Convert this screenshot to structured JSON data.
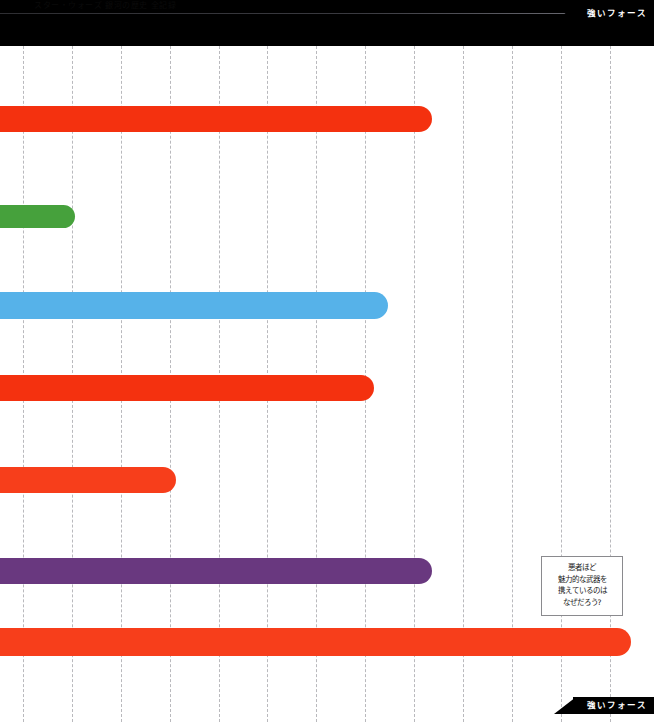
{
  "header": {
    "title": "スター・ウォーズ 銀河の歴史 全記録"
  },
  "tabs": {
    "top_label": "強いフォース",
    "bottom_label": "強いフォース"
  },
  "callout": {
    "lines": [
      "悪者ほど",
      "魅力的な武器を",
      "携えているのは",
      "なぜだろう?"
    ]
  },
  "colors": {
    "red": "#F4310F",
    "red_alt": "#F73E1B",
    "green": "#46A13C",
    "blue": "#56B2E9",
    "purple": "#69387F",
    "grid": "#b9b9bd",
    "black": "#000000",
    "background": "#ffffff"
  },
  "chart_data": {
    "type": "bar",
    "orientation": "horizontal",
    "title": "強いフォース",
    "xlabel": "",
    "ylabel": "",
    "grid": true,
    "legend_position": "none",
    "note": "Horizontal bars extend from off-canvas left edge to the right; values are the pixel x-coordinate of each bar's right end within a 654px-wide canvas.",
    "axis": {
      "gridline_spacing_px": 48.8,
      "gridline_x": [
        23,
        72,
        121,
        170,
        219,
        267,
        316,
        365,
        414,
        463,
        512,
        561,
        610
      ]
    },
    "categories": [
      "bar-1",
      "bar-2",
      "bar-3",
      "bar-4",
      "bar-5",
      "bar-6",
      "bar-7"
    ],
    "values": [
      432,
      75,
      388,
      432,
      176,
      432,
      631
    ],
    "series": [
      {
        "name": "strong-force-bars",
        "bars": [
          {
            "index": 1,
            "color": "#F4310F",
            "end_px": 432,
            "top_px": 106,
            "height_px": 26
          },
          {
            "index": 2,
            "color": "#46A13C",
            "end_px": 75,
            "top_px": 205,
            "height_px": 23
          },
          {
            "index": 3,
            "color": "#56B2E9",
            "end_px": 388,
            "top_px": 292,
            "height_px": 27
          },
          {
            "index": 4,
            "color": "#F4310F",
            "end_px": 374,
            "top_px": 375,
            "height_px": 26
          },
          {
            "index": 5,
            "color": "#F73E1B",
            "end_px": 176,
            "top_px": 467,
            "height_px": 26
          },
          {
            "index": 6,
            "color": "#69387F",
            "end_px": 432,
            "top_px": 558,
            "height_px": 26
          },
          {
            "index": 7,
            "color": "#F73E1B",
            "end_px": 631,
            "top_px": 628,
            "height_px": 28
          }
        ]
      }
    ]
  }
}
